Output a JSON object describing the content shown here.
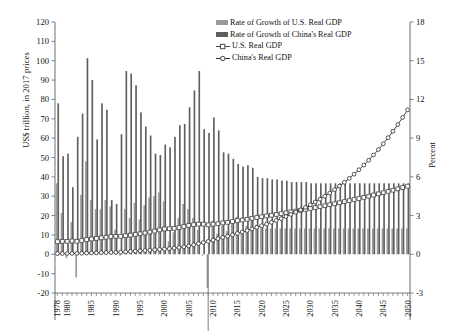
{
  "axes": {
    "left": {
      "title": "US$ trillion, in 2017 prices",
      "min": -20,
      "max": 120,
      "step": 10,
      "ticks": [
        120,
        110,
        100,
        90,
        80,
        70,
        60,
        50,
        40,
        30,
        20,
        10,
        0,
        -10,
        -20
      ]
    },
    "right": {
      "title": "Percent",
      "min": -3,
      "max": 18,
      "step": 3,
      "ticks": [
        18,
        15,
        12,
        9,
        6,
        3,
        0,
        -3
      ]
    },
    "x": {
      "tick_labels": [
        "1978",
        "1980",
        "1985",
        "1990",
        "1995",
        "2000",
        "2005",
        "2010",
        "2015",
        "2020",
        "2025",
        "2030",
        "2035",
        "2040",
        "2045",
        "2050"
      ],
      "start": 1978,
      "end": 2050
    }
  },
  "legend": {
    "items": [
      {
        "label": "Rate of Growth of U.S. Real GDP",
        "type": "bar",
        "color": "#9a9a9a"
      },
      {
        "label": "Rate of Growth of China's Real GDP",
        "type": "bar",
        "color": "#5e5e5e"
      },
      {
        "label": "U.S. Real GDP",
        "type": "line",
        "color": "#4a4a4a",
        "marker": "open-square"
      },
      {
        "label": "China's Real GDP",
        "type": "line",
        "color": "#2e2e2e",
        "marker": "open-circle"
      }
    ]
  },
  "colors": {
    "bar_us": "#9a9a9a",
    "bar_china": "#5e5e5e",
    "line_us": "#4a4a4a",
    "line_china": "#2e2e2e",
    "axis": "#6f6f6f",
    "text": "#111111"
  },
  "chart_data": {
    "type": "bar",
    "title": "",
    "xlabel": "",
    "ylabel": "US$ trillion, in 2017 prices",
    "ylabel_secondary": "Percent",
    "ylim": [
      -20,
      120
    ],
    "ylim_secondary": [
      -3,
      18
    ],
    "grid": false,
    "legend_position": "top-right",
    "x": [
      1978,
      1979,
      1980,
      1981,
      1982,
      1983,
      1984,
      1985,
      1986,
      1987,
      1988,
      1989,
      1990,
      1991,
      1992,
      1993,
      1994,
      1995,
      1996,
      1997,
      1998,
      1999,
      2000,
      2001,
      2002,
      2003,
      2004,
      2005,
      2006,
      2007,
      2008,
      2009,
      2010,
      2011,
      2012,
      2013,
      2014,
      2015,
      2016,
      2017,
      2018,
      2019,
      2020,
      2021,
      2022,
      2023,
      2024,
      2025,
      2026,
      2027,
      2028,
      2029,
      2030,
      2031,
      2032,
      2033,
      2034,
      2035,
      2036,
      2037,
      2038,
      2039,
      2040,
      2041,
      2042,
      2043,
      2044,
      2045,
      2046,
      2047,
      2048,
      2049,
      2050
    ],
    "series": [
      {
        "name": "Rate of Growth of U.S. Real GDP",
        "axis": "right",
        "unit": "percent",
        "kind": "bar",
        "color": "#9a9a9a",
        "values": [
          5.5,
          3.2,
          -0.3,
          2.5,
          -1.8,
          4.6,
          7.2,
          4.2,
          3.5,
          3.5,
          4.2,
          3.7,
          1.9,
          -0.1,
          3.5,
          2.8,
          4.0,
          2.7,
          3.8,
          4.4,
          4.5,
          4.8,
          4.1,
          1.0,
          1.7,
          2.8,
          3.9,
          3.5,
          2.8,
          1.9,
          -0.1,
          -2.6,
          2.6,
          1.6,
          2.2,
          1.8,
          2.5,
          2.9,
          1.6,
          2.2,
          2.9,
          2.3,
          2.0,
          2.0,
          2.0,
          2.0,
          2.0,
          2.0,
          2.0,
          2.0,
          2.0,
          2.0,
          2.0,
          2.0,
          2.0,
          2.0,
          2.0,
          2.0,
          2.0,
          2.0,
          2.0,
          2.0,
          2.0,
          2.0,
          2.0,
          2.0,
          2.0,
          2.0,
          2.0,
          2.0,
          2.0,
          2.0,
          2.0
        ]
      },
      {
        "name": "Rate of Growth of China's Real GDP",
        "axis": "right",
        "unit": "percent",
        "kind": "bar",
        "color": "#5e5e5e",
        "values": [
          11.7,
          7.6,
          7.8,
          5.2,
          9.1,
          10.9,
          15.2,
          13.5,
          8.9,
          11.7,
          11.2,
          4.2,
          3.9,
          9.3,
          14.2,
          14.0,
          13.1,
          11.0,
          9.9,
          9.2,
          7.8,
          7.7,
          8.5,
          8.3,
          9.1,
          10.0,
          10.1,
          11.4,
          12.7,
          14.2,
          9.7,
          9.4,
          10.6,
          9.6,
          7.9,
          7.8,
          7.4,
          7.0,
          6.8,
          6.9,
          6.7,
          6.0,
          5.9,
          5.9,
          5.8,
          5.8,
          5.7,
          5.7,
          5.6,
          5.6,
          5.6,
          5.6,
          5.5,
          5.5,
          5.5,
          5.5,
          5.5,
          5.5,
          5.5,
          5.5,
          5.5,
          5.5,
          5.5,
          5.5,
          5.5,
          5.5,
          5.5,
          5.5,
          5.5,
          5.5,
          5.5,
          5.5,
          5.5
        ]
      },
      {
        "name": "U.S. Real GDP",
        "axis": "left",
        "unit": "US$ trillion, in 2017 prices",
        "kind": "line",
        "marker": "open-square",
        "color": "#4a4a4a",
        "values": [
          6.5,
          6.7,
          6.7,
          6.9,
          6.7,
          7.1,
          7.6,
          7.9,
          8.2,
          8.5,
          8.8,
          9.2,
          9.3,
          9.3,
          9.6,
          9.9,
          10.3,
          10.6,
          11.0,
          11.5,
          12.0,
          12.6,
          13.1,
          13.2,
          13.4,
          13.8,
          14.4,
          14.9,
          15.3,
          15.6,
          15.6,
          15.2,
          15.6,
          15.8,
          16.2,
          16.5,
          16.9,
          17.4,
          17.7,
          18.1,
          18.6,
          19.0,
          19.4,
          19.8,
          20.2,
          20.6,
          21.0,
          21.4,
          21.9,
          22.3,
          22.7,
          23.2,
          23.7,
          24.1,
          24.6,
          25.1,
          25.6,
          26.1,
          26.6,
          27.2,
          27.7,
          28.3,
          28.8,
          29.4,
          30.0,
          30.6,
          31.2,
          31.8,
          32.5,
          33.1,
          33.8,
          34.5,
          35.2
        ]
      },
      {
        "name": "China's Real GDP",
        "axis": "left",
        "unit": "US$ trillion, in 2017 prices",
        "kind": "line",
        "marker": "open-circle",
        "color": "#2e2e2e",
        "values": [
          0.35,
          0.38,
          0.41,
          0.43,
          0.47,
          0.52,
          0.6,
          0.68,
          0.74,
          0.83,
          0.92,
          0.96,
          1.0,
          1.09,
          1.25,
          1.42,
          1.61,
          1.79,
          1.96,
          2.14,
          2.31,
          2.49,
          2.7,
          2.92,
          3.19,
          3.51,
          3.86,
          4.3,
          4.85,
          5.54,
          6.08,
          6.65,
          7.35,
          8.06,
          8.7,
          9.38,
          10.07,
          10.77,
          11.5,
          12.3,
          13.12,
          13.91,
          14.73,
          15.6,
          16.5,
          17.46,
          18.45,
          19.5,
          20.59,
          21.74,
          22.96,
          24.24,
          25.57,
          26.98,
          28.46,
          30.02,
          31.67,
          33.41,
          35.25,
          37.19,
          39.23,
          41.39,
          43.67,
          46.07,
          48.6,
          51.28,
          54.1,
          57.08,
          60.22,
          63.53,
          67.03,
          70.72,
          74.61
        ]
      }
    ]
  }
}
